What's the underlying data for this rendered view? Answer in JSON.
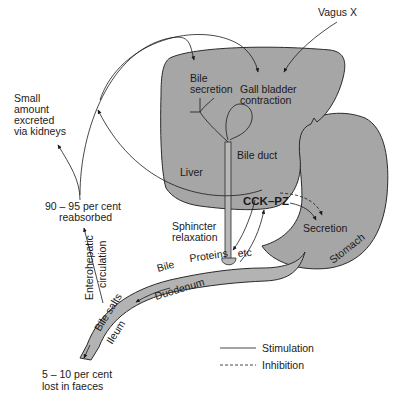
{
  "diagram": {
    "organs": {
      "liver": "Liver",
      "stomach": "Stomach",
      "duodenum": "Duodenum",
      "ileum": "Ileum",
      "bile_duct": "Bile duct"
    },
    "labels": {
      "vagus": "Vagus X",
      "bile_secretion_1": "Bile",
      "bile_secretion_2": "secretion",
      "gall_bladder_1": "Gall bladder",
      "gall_bladder_2": "contraction",
      "small_amount_1": "Small",
      "small_amount_2": "amount",
      "small_amount_3": "excreted",
      "small_amount_4": "via kidneys",
      "reabsorbed_1": "90 – 95 per cent",
      "reabsorbed_2": "reabsorbed",
      "enterohepatic_1": "Enterohepatic",
      "enterohepatic_2": "circulation",
      "cck_pz": "CCK–PZ",
      "sphincter_1": "Sphincter",
      "sphincter_2": "relaxation",
      "secretion": "Secretion",
      "bile_gut": "Bile",
      "proteins": "Proteins",
      "etc": "etc",
      "bile_salts": "Bile salts",
      "lost_1": "5 – 10 per cent",
      "lost_2": "lost in faeces"
    },
    "legend": {
      "stimulation": "Stimulation",
      "inhibition": "Inhibition"
    },
    "colors": {
      "organ_fill": "#a6a6a6",
      "gut_fill": "#b3b3b3",
      "line": "#1a1a1a"
    }
  }
}
